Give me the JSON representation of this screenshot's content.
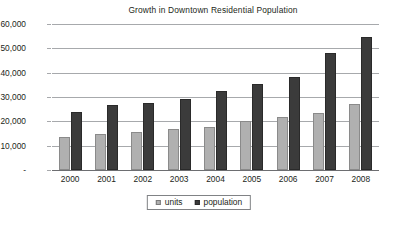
{
  "chart_data": {
    "type": "bar",
    "title": "Growth in Downtown Residential Population",
    "xlabel": "",
    "ylabel": "",
    "categories": [
      "2000",
      "2001",
      "2002",
      "2003",
      "2004",
      "2005",
      "2006",
      "2007",
      "2008"
    ],
    "series": [
      {
        "name": "units",
        "color": "#b0b0b0",
        "values": [
          13500,
          14700,
          15800,
          17000,
          17700,
          20100,
          21900,
          23500,
          27300
        ]
      },
      {
        "name": "population",
        "color": "#3b3b3b",
        "values": [
          23800,
          26700,
          27400,
          29300,
          32300,
          35200,
          38400,
          48200,
          54500
        ]
      }
    ],
    "ylim": [
      0,
      60000
    ],
    "ytick_values": [
      0,
      10000,
      20000,
      30000,
      40000,
      50000,
      60000
    ],
    "ytick_labels": [
      "-",
      "10,000",
      "20,000",
      "30,000",
      "40,000",
      "50,000",
      "60,000"
    ],
    "grid": true,
    "legend_position": "bottom-center",
    "legend_entries": [
      "units",
      "population"
    ]
  },
  "legend": {
    "units_label": "units",
    "population_label": "population"
  }
}
